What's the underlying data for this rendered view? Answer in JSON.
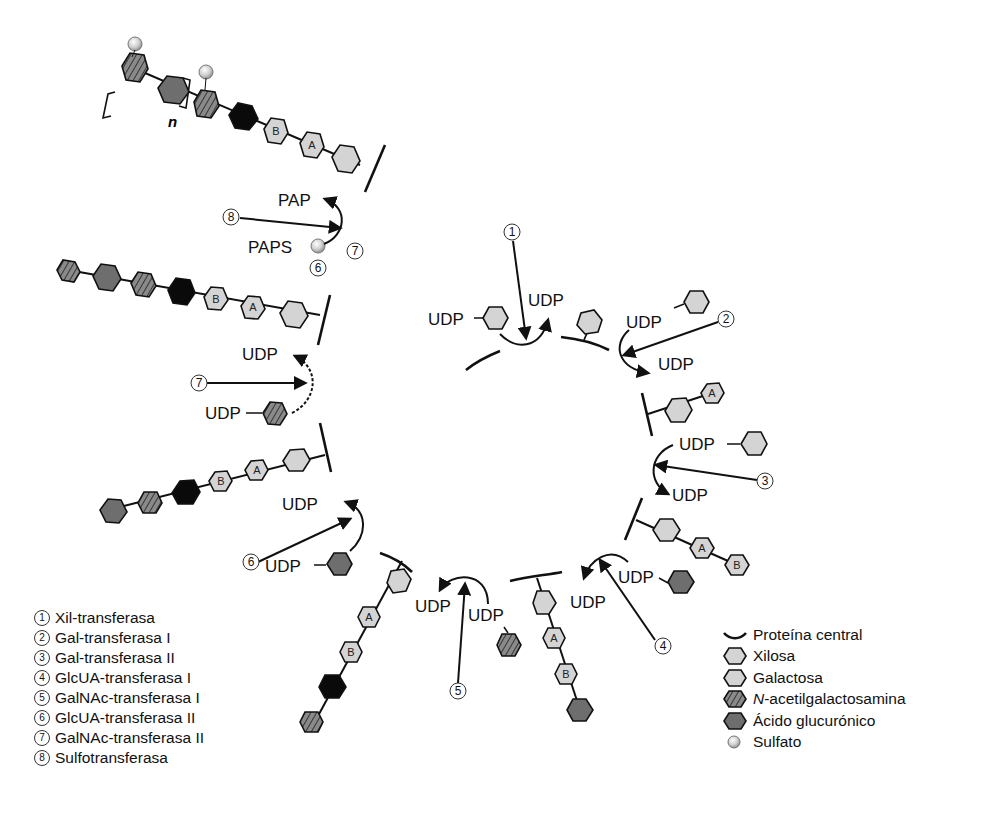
{
  "diagram": {
    "title": "",
    "type": "glycosaminoglycan chain biosynthesis cycle",
    "labels": {
      "udp": "UDP",
      "pap": "PAP",
      "paps": "PAPS",
      "repeat_n": "n",
      "hex_a": "A",
      "hex_b": "B"
    },
    "enzyme_numbers": [
      "1",
      "2",
      "3",
      "4",
      "5",
      "6",
      "7",
      "8"
    ]
  },
  "enzymes_legend": [
    {
      "num": "1",
      "label": "Xil-transferasa"
    },
    {
      "num": "2",
      "label": "Gal-transferasa I"
    },
    {
      "num": "3",
      "label": "Gal-transferasa II"
    },
    {
      "num": "4",
      "label": "GlcUA-transferasa I"
    },
    {
      "num": "5",
      "label": "GalNAc-transferasa I"
    },
    {
      "num": "6",
      "label": "GlcUA-transferasa II"
    },
    {
      "num": "7",
      "label": "GalNAc-transferasa II"
    },
    {
      "num": "8",
      "label": "Sulfotransferasa"
    }
  ],
  "symbols_legend": [
    {
      "symbol": "core-protein-arc",
      "label": "Proteína central"
    },
    {
      "symbol": "hexagon-light",
      "label": "Xilosa"
    },
    {
      "symbol": "hexagon-light",
      "label": "Galactosa"
    },
    {
      "symbol": "hexagon-striped",
      "label_italic": "N",
      "label": "-acetilgalactosamina"
    },
    {
      "symbol": "hexagon-dark",
      "label": "Ácido glucurónico"
    },
    {
      "symbol": "sphere",
      "label": "Sulfato"
    }
  ],
  "colors": {
    "light_sugar": "#d4d4d4",
    "glcua": "#6e6e6e",
    "galnac": "#7a7a7a",
    "black_sugar": "#0a0a0a",
    "line": "#111111",
    "sulfate": "#cfcfcf"
  }
}
